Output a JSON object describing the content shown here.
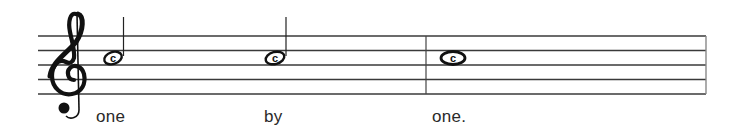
{
  "score": {
    "clef": "treble",
    "staff": {
      "x_start": 38,
      "x_end": 706,
      "lines_y": [
        36,
        50,
        65,
        79,
        94
      ],
      "color": "#3a3a3a"
    },
    "barlines": [
      {
        "x": 426,
        "type": "single"
      },
      {
        "x": 706,
        "type": "final-edge"
      }
    ],
    "notes": [
      {
        "type": "half",
        "pitch": "C (space above middle line, on G-line region)",
        "x": 116,
        "y": 58,
        "stem": "up",
        "label": "c"
      },
      {
        "type": "half",
        "pitch": "C",
        "x": 275,
        "y": 58,
        "stem": "up",
        "label": "c"
      },
      {
        "type": "whole",
        "pitch": "C",
        "x": 453,
        "y": 58,
        "label": "c"
      }
    ],
    "lyrics": [
      {
        "text": "one",
        "x": 96
      },
      {
        "text": "by",
        "x": 264
      },
      {
        "text": "one.",
        "x": 432
      }
    ]
  }
}
